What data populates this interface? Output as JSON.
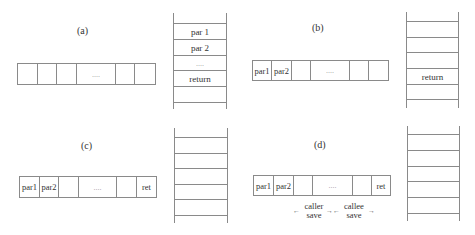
{
  "panels": {
    "a": {
      "label": "(a)",
      "array": [
        "",
        "",
        "",
        "....",
        "",
        ""
      ],
      "stack": [
        "par 1",
        "par 2",
        "....",
        "return",
        ""
      ]
    },
    "b": {
      "label": "(b)",
      "array": [
        "par1",
        "par2",
        "",
        "....",
        "",
        ""
      ],
      "stack": [
        "",
        "",
        "",
        "return",
        ""
      ]
    },
    "c": {
      "label": "(c)",
      "array": [
        "par1",
        "par2",
        "",
        "....",
        "",
        "ret"
      ],
      "stack": [
        "",
        "",
        "",
        "",
        ""
      ]
    },
    "d": {
      "label": "(d)",
      "array": [
        "par1",
        "par2",
        "",
        "....",
        "",
        "ret"
      ],
      "stack": [
        "",
        "",
        "",
        "",
        ""
      ],
      "annotations": {
        "caller_save": "caller\nsave",
        "callee_save": "callee\nsave",
        "left_arrow": "←",
        "right_arrow": "→"
      }
    }
  }
}
